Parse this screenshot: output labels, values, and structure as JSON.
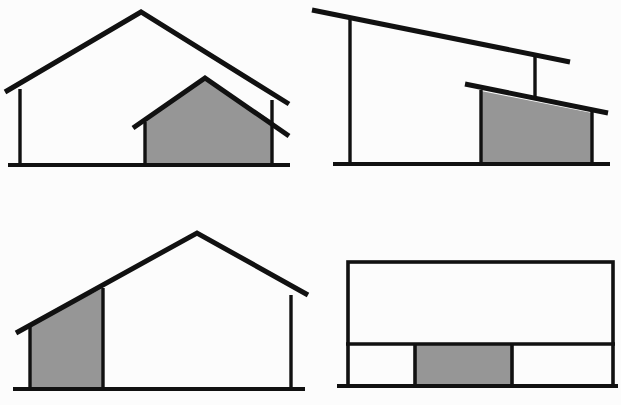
{
  "document": {
    "title": "Building Massing Elevation Variants",
    "description": "Four line-drawn architectural elevations, each showing a building envelope with one shaded volume.",
    "width": 621,
    "height": 405,
    "background_color": "#fcfcfc"
  },
  "style": {
    "line_color": "#111111",
    "shade_fill": "#969696",
    "shade_stroke": "#111111",
    "roof_stroke_width": 5,
    "wall_stroke_width": 3.4,
    "ground_stroke_width": 4
  },
  "panels": [
    {
      "id": "top-left",
      "name": "gable-with-inner-gable",
      "roof_type": "gable",
      "shaded_part": "inner-gabled-volume-right",
      "ground": {
        "x1": 8,
        "x2": 290,
        "y": 165
      },
      "posts": [
        {
          "x": 20,
          "y1": 165,
          "y2": 89
        },
        {
          "x": 272,
          "y1": 165,
          "y2": 100
        }
      ],
      "roof_polyline": "5,92 141,12 289,104",
      "shade_polygon": "145,165 145,121 205,78 272,121 272,165",
      "shade_roof_polyline": "133,128 205,78 289,136"
    },
    {
      "id": "top-right",
      "name": "monopitch-with-inner-monopitch",
      "roof_type": "shed",
      "shaded_part": "inner-shed-volume-right",
      "ground": {
        "x1": 333,
        "x2": 610,
        "y": 164
      },
      "posts": [
        {
          "x": 350,
          "y1": 164,
          "y2": 17
        },
        {
          "x": 535,
          "y1": 55,
          "y2": 95
        }
      ],
      "roof_polyline": "312,10 570,62",
      "shade_polygon": "481,91 592,113 592,164 481,164",
      "shade_roof_polyline": "465,84 608,113"
    },
    {
      "id": "bottom-left",
      "name": "gable-with-lean-to-bay-left",
      "roof_type": "gable",
      "shaded_part": "left-bay-under-roof-slope",
      "ground": {
        "x1": 13,
        "x2": 305,
        "y": 389
      },
      "posts": [
        {
          "x": 30,
          "y1": 389,
          "y2": 325
        },
        {
          "x": 291,
          "y1": 389,
          "y2": 295
        }
      ],
      "roof_polyline": "16,333 197,233 308,295",
      "shade_polygon": "30,389 30,325 103,288 103,389"
    },
    {
      "id": "bottom-right",
      "name": "flat-roof-two-band-three-bay",
      "roof_type": "flat",
      "shaded_part": "center-bay-lower-band",
      "ground": {
        "x1": 337,
        "x2": 618,
        "y": 386
      },
      "outline_rect": {
        "x": 348,
        "y": 262,
        "width": 265,
        "height": 124
      },
      "band_divider": {
        "x1": 348,
        "x2": 613,
        "y": 344
      },
      "bay_dividers": [
        415,
        512
      ],
      "shade_rect": {
        "x": 415,
        "y": 344,
        "width": 97,
        "height": 42
      }
    }
  ]
}
